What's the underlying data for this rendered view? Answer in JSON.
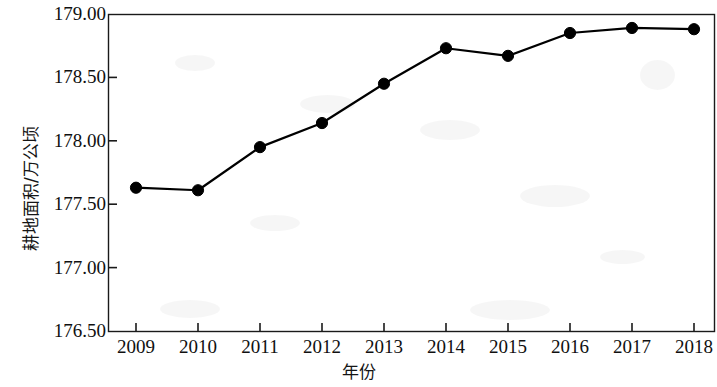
{
  "chart_data": {
    "type": "line",
    "title": "",
    "xlabel": "年份",
    "ylabel": "耕地面积/万公顷",
    "categories": [
      "2009",
      "2010",
      "2011",
      "2012",
      "2013",
      "2014",
      "2015",
      "2016",
      "2017",
      "2018"
    ],
    "values": [
      177.63,
      177.61,
      177.95,
      178.14,
      178.45,
      178.73,
      178.67,
      178.85,
      178.89,
      178.88
    ],
    "series": [
      {
        "name": "耕地面积",
        "values": [
          177.63,
          177.61,
          177.95,
          178.14,
          178.45,
          178.73,
          178.67,
          178.85,
          178.89,
          178.88
        ]
      }
    ],
    "ylim": [
      176.5,
      179.0
    ],
    "ytick_labels": [
      "179.00",
      "178.50",
      "178.00",
      "177.50",
      "177.00",
      "176.50"
    ],
    "ytick_values": [
      179.0,
      178.5,
      178.0,
      177.5,
      177.0,
      176.5
    ],
    "ytick_step": 0.5,
    "xtick_labels": [
      "2009",
      "2010",
      "2011",
      "2012",
      "2013",
      "2014",
      "2015",
      "2016",
      "2017",
      "2018"
    ],
    "grid": false,
    "legend": null,
    "legend_position": "none",
    "marker": "filled-circle",
    "line_color": "#000000",
    "marker_color": "#000000",
    "background_color": "#ffffff",
    "frame_color": "#1a1a1a",
    "annotations": []
  }
}
